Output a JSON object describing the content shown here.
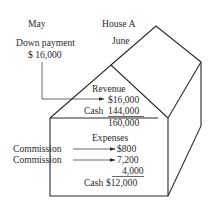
{
  "labels": {
    "month_may": "May",
    "house": "House A",
    "month_june": "June",
    "down_payment_label": "Down payment",
    "down_payment_value": "$ 16,000"
  },
  "revenue": {
    "title": "Revenue",
    "line1": "$16,000",
    "cash_label": "Cash",
    "line2": "144,000",
    "total": "160,000"
  },
  "expenses": {
    "title": "Expenses",
    "commission1_label": "Commission",
    "line1": "$800",
    "commission2_label": "Commission",
    "line2": "7,200",
    "line3": "4,000",
    "cash_label": "Cash",
    "total": "$12,000"
  },
  "colors": {
    "ink": "#2a2a2a",
    "background": "#ffffff"
  }
}
